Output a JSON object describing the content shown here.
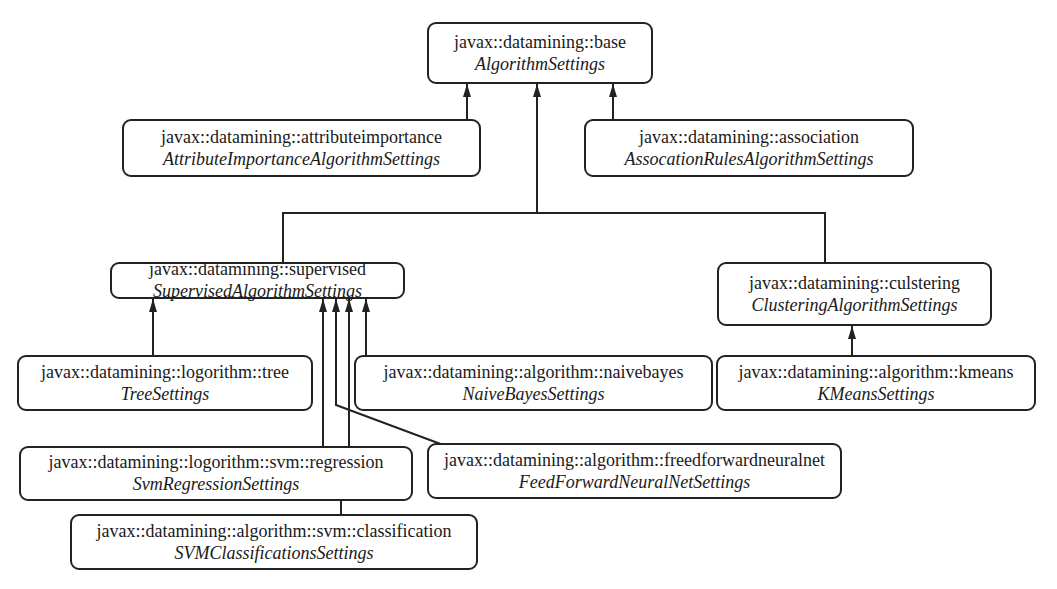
{
  "diagram": {
    "type": "class-inheritance-hierarchy",
    "nodes": {
      "base": {
        "package": "javax::datamining::base",
        "class": "AlgorithmSettings"
      },
      "attributeimportance": {
        "package": "javax::datamining::attributeimportance",
        "class": "AttributeImportanceAlgorithmSettings"
      },
      "association": {
        "package": "javax::datamining::association",
        "class": "AssocationRulesAlgorithmSettings"
      },
      "supervised": {
        "package": "javax::datamining::supervised",
        "class": "SupervisedAlgorithmSettings"
      },
      "clustering": {
        "package": "javax::datamining::culstering",
        "class": "ClusteringAlgorithmSettings"
      },
      "tree": {
        "package": "javax::datamining::logorithm::tree",
        "class": "TreeSettings"
      },
      "naivebayes": {
        "package": "javax::datamining::algorithm::naivebayes",
        "class": "NaiveBayesSettings"
      },
      "kmeans": {
        "package": "javax::datamining::algorithm::kmeans",
        "class": "KMeansSettings"
      },
      "svm_regression": {
        "package": "javax::datamining::logorithm::svm::regression",
        "class": "SvmRegressionSettings"
      },
      "feedforward": {
        "package": "javax::datamining::algorithm::freedforwardneuralnet",
        "class": "FeedForwardNeuralNetSettings"
      },
      "svm_classification": {
        "package": "javax::datamining::algorithm::svm::classification",
        "class": "SVMClassificationsSettings"
      }
    },
    "edges": [
      {
        "from": "attributeimportance",
        "to": "base"
      },
      {
        "from": "association",
        "to": "base"
      },
      {
        "from": "supervised",
        "to": "base"
      },
      {
        "from": "clustering",
        "to": "base"
      },
      {
        "from": "tree",
        "to": "supervised"
      },
      {
        "from": "naivebayes",
        "to": "supervised"
      },
      {
        "from": "svm_regression",
        "to": "supervised"
      },
      {
        "from": "feedforward",
        "to": "supervised"
      },
      {
        "from": "svm_classification",
        "to": "supervised"
      },
      {
        "from": "kmeans",
        "to": "clustering"
      }
    ],
    "line_color": "#222222"
  }
}
